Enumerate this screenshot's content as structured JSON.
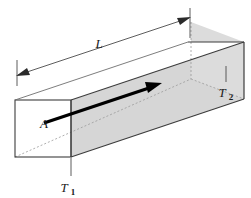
{
  "figure": {
    "background_color": "#ffffff",
    "labels": {
      "length": "L",
      "area": "A",
      "temperature_hot_base": "T",
      "temperature_hot_sub": "1",
      "temperature_cold_base": "T",
      "temperature_cold_sub": "2"
    },
    "colors": {
      "shaded_face": "#d6d6d6",
      "end_face": "#dcdcdc",
      "top_face": "#ffffff",
      "front_face": "#ffffff",
      "outline": "#3c3c3c",
      "hidden_edge": "#9a9a9a",
      "dimension_line": "#4a4a4a",
      "flow_arrow": "#000000",
      "text": "#1a1a1a"
    },
    "elements": {
      "flow_arrow_name": "heat-flow-arrow",
      "length_dimension_name": "length-dimension-line",
      "cross_section_name": "cross-section-face",
      "bar_name": "conducting-bar"
    }
  }
}
